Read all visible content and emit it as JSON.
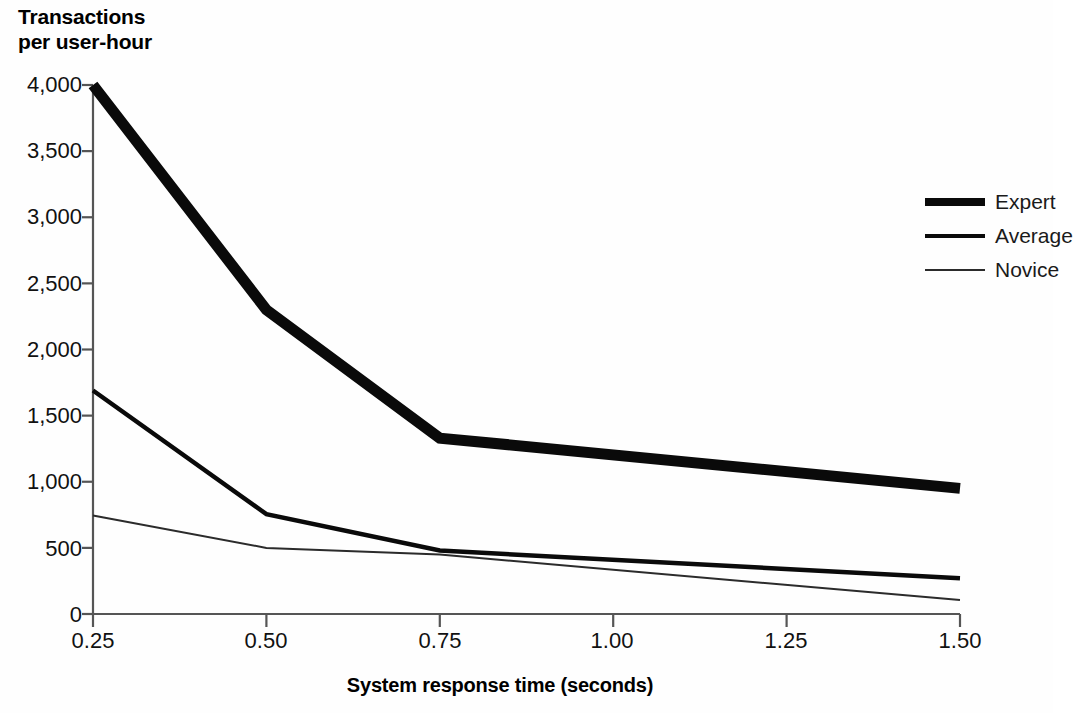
{
  "chart_data": {
    "type": "line",
    "title": "",
    "ylabel": "Transactions\nper user-hour",
    "xlabel": "System  response time (seconds)",
    "x": [
      0.25,
      0.5,
      0.75,
      1.0,
      1.25,
      1.5
    ],
    "xtick_labels": [
      "0.25",
      "0.50",
      "0.75",
      "1.00",
      "1.25",
      "1.50"
    ],
    "ytick_labels": [
      "0",
      "500",
      "1,000",
      "1,500",
      "2,000",
      "2,500",
      "3,000",
      "3,500",
      "4,000"
    ],
    "ytick_values": [
      0,
      500,
      1000,
      1500,
      2000,
      2500,
      3000,
      3500,
      4000
    ],
    "xlim": [
      0.25,
      1.5
    ],
    "ylim": [
      0,
      4000
    ],
    "grid": false,
    "legend_position": "right",
    "series": [
      {
        "name": "Expert",
        "line_weight": "thick",
        "color": "#0a0a0a",
        "x": [
          0.25,
          0.5,
          0.75,
          1.5
        ],
        "values": [
          4000,
          2300,
          1330,
          950
        ]
      },
      {
        "name": "Average",
        "line_weight": "medium",
        "color": "#0a0a0a",
        "x": [
          0.25,
          0.5,
          0.75,
          1.5
        ],
        "values": [
          1690,
          755,
          480,
          270
        ]
      },
      {
        "name": "Novice",
        "line_weight": "thin",
        "color": "#2b2b2b",
        "x": [
          0.25,
          0.5,
          0.75,
          1.5
        ],
        "values": [
          745,
          500,
          450,
          105
        ]
      }
    ]
  },
  "axis": {
    "y_title_line1": "Transactions",
    "y_title_line2": "per user-hour",
    "x_title": "System  response time (seconds)"
  },
  "legend": {
    "items": [
      {
        "label": "Expert"
      },
      {
        "label": "Average"
      },
      {
        "label": "Novice"
      }
    ]
  },
  "yticks": [
    {
      "label": "4,000"
    },
    {
      "label": "3,500"
    },
    {
      "label": "3,000"
    },
    {
      "label": "2,500"
    },
    {
      "label": "2,000"
    },
    {
      "label": "1,500"
    },
    {
      "label": "1,000"
    },
    {
      "label": "500"
    },
    {
      "label": "0"
    }
  ],
  "xticks": [
    {
      "label": "0.25"
    },
    {
      "label": "0.50"
    },
    {
      "label": "0.75"
    },
    {
      "label": "1.00"
    },
    {
      "label": "1.25"
    },
    {
      "label": "1.50"
    }
  ]
}
